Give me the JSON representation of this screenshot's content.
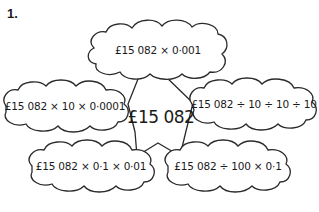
{
  "question_number": "1.",
  "center": {
    "value": "£15 082"
  },
  "clouds": [
    {
      "position": "top",
      "expression": "£15 082 × 0·001"
    },
    {
      "position": "left",
      "expression": "£15 082 × 10 × 0·0001"
    },
    {
      "position": "right",
      "expression": "£15 082 ÷ 10 ÷ 10 ÷ 10"
    },
    {
      "position": "bottom-left",
      "expression": "£15 082 × 0·1 × 0·01"
    },
    {
      "position": "bottom-right",
      "expression": "£15 082 ÷ 100 × 0·1"
    }
  ],
  "colors": {
    "stroke": "#2a2a2a",
    "background": "#ffffff",
    "text": "#1a1a1a"
  }
}
